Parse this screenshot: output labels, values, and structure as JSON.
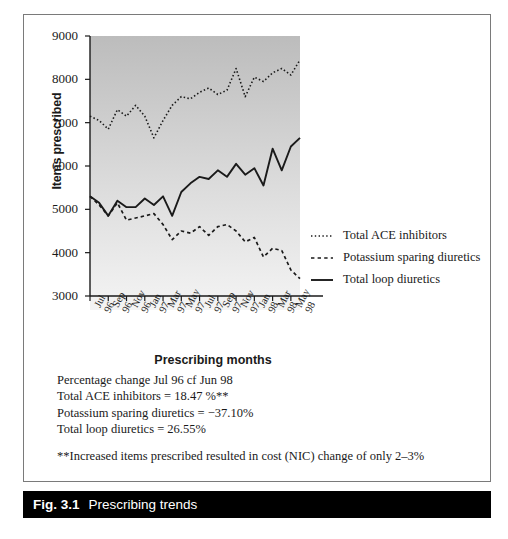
{
  "figure": {
    "caption_number": "Fig. 3.1",
    "caption_text": "Prescribing trends"
  },
  "notes": {
    "line1": "Percentage change Jul 96 cf Jun 98",
    "line2": "Total ACE inhibitors = 18.47 %**",
    "line3": "Potassium sparing diuretics = −37.10%",
    "line4": "Total loop diuretics = 26.55%",
    "line5": "**Increased items prescribed resulted in cost (NIC) change of only 2–3%"
  },
  "legend": {
    "items": [
      {
        "label": "Total ACE inhibitors",
        "style": "dotted"
      },
      {
        "label": "Potassium sparing diuretics",
        "style": "dashed"
      },
      {
        "label": "Total loop diuretics",
        "style": "solid"
      }
    ]
  },
  "chart_data": {
    "type": "line",
    "title": "Prescribing trends",
    "xlabel": "Prescribing months",
    "ylabel": "Items prescribed",
    "ylim": [
      3000,
      9000
    ],
    "yticks": [
      3000,
      4000,
      5000,
      6000,
      7000,
      8000,
      9000
    ],
    "grid": false,
    "legend_position": "right",
    "x": [
      "Jul 96",
      "Aug 96",
      "Sep 96",
      "Oct 96",
      "Nov 96",
      "Dec 96",
      "Jan 97",
      "Feb 97",
      "Mar 97",
      "Apr 97",
      "May 97",
      "Jun 97",
      "Jul 97",
      "Aug 97",
      "Sep 97",
      "Oct 97",
      "Nov 97",
      "Dec 97",
      "Jan 98",
      "Feb 98",
      "Mar 98",
      "Apr 98",
      "May 98",
      "Jun 98"
    ],
    "xtick_labels": [
      "Jul 96",
      "Sep 96",
      "Nov 96",
      "Jan 97",
      "Mar 97",
      "May 97",
      "Jul 97",
      "Sep 97",
      "Nov 97",
      "Jan 98",
      "Mar 98",
      "May 98"
    ],
    "series": [
      {
        "name": "Total ACE inhibitors",
        "style": "dotted",
        "values": [
          7150,
          7050,
          6850,
          7300,
          7150,
          7400,
          7150,
          6650,
          7050,
          7400,
          7600,
          7550,
          7700,
          7800,
          7650,
          7750,
          8250,
          7600,
          8050,
          7950,
          8150,
          8250,
          8100,
          8450
        ]
      },
      {
        "name": "Potassium sparing diuretics",
        "style": "dashed",
        "values": [
          5300,
          5100,
          4850,
          5150,
          4750,
          4800,
          4850,
          4900,
          4650,
          4300,
          4500,
          4450,
          4600,
          4400,
          4600,
          4650,
          4500,
          4250,
          4350,
          3900,
          4100,
          4050,
          3600,
          3400
        ]
      },
      {
        "name": "Total loop diuretics",
        "style": "solid",
        "values": [
          5300,
          5150,
          4850,
          5200,
          5050,
          5050,
          5250,
          5100,
          5300,
          4850,
          5400,
          5600,
          5750,
          5700,
          5900,
          5750,
          6050,
          5800,
          5950,
          5550,
          6400,
          5900,
          6450,
          6650
        ]
      }
    ]
  },
  "colors": {
    "panel_top": "#bcbcbc",
    "panel_bottom": "#f2f2f2",
    "line": "#1a1a1a",
    "caption_bar": "#000000"
  }
}
